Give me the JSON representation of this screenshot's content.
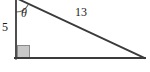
{
  "figure": {
    "type": "right-triangle-diagram",
    "labels": {
      "vertical_leg": "5",
      "hypotenuse": "13",
      "angle": "θ"
    },
    "colors": {
      "stroke": "#3b3b3b",
      "arc": "#6b6b6b",
      "right_angle_fill": "#c8c8c8",
      "right_angle_stroke": "#8a8a8a",
      "background": "#ffffff",
      "text": "#1a1a1a"
    },
    "geometry": {
      "apex": [
        16,
        -1
      ],
      "right_angle_vertex": [
        16,
        58
      ],
      "far_vertex": [
        144,
        58
      ],
      "right_angle_marker": [
        18,
        45,
        12,
        12
      ],
      "angle_arc_radius": 13
    }
  }
}
